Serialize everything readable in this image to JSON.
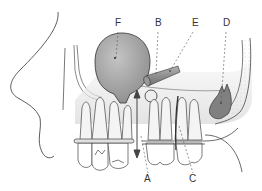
{
  "diagram": {
    "type": "anatomical-dental-cross-section",
    "labels": [
      {
        "id": "A",
        "text": "A",
        "x": 147,
        "y": 180
      },
      {
        "id": "B",
        "text": "B",
        "x": 157,
        "y": 20
      },
      {
        "id": "C",
        "text": "C",
        "x": 192,
        "y": 180
      },
      {
        "id": "D",
        "text": "D",
        "x": 224,
        "y": 20
      },
      {
        "id": "E",
        "text": "E",
        "x": 193,
        "y": 20
      },
      {
        "id": "F",
        "text": "F",
        "x": 116,
        "y": 20
      }
    ],
    "colors": {
      "line": "#333333",
      "sinus_fill": "#a0a0a0",
      "tooth_dark": "#808080",
      "tooth_light": "#f2f2f2",
      "bone_dots": "#d9d9d9",
      "shade": "#e6e6e6"
    }
  }
}
